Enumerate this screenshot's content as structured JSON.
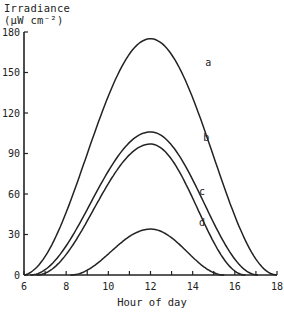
{
  "chart_data": {
    "type": "line",
    "title": "",
    "xlabel": "Hour of day",
    "ylabel_line1": "Irradiance",
    "ylabel_line2": "(μW cm⁻²)",
    "xlim": [
      6,
      18
    ],
    "ylim": [
      0,
      180
    ],
    "xticks": [
      6,
      8,
      10,
      12,
      14,
      16,
      18
    ],
    "xminor_ticks": [
      7,
      9,
      11,
      13,
      15,
      17
    ],
    "yticks": [
      0,
      30,
      60,
      90,
      120,
      150,
      180
    ],
    "grid": false,
    "legend": "curve labels placed beside curves",
    "series": [
      {
        "name": "a",
        "start": 5.9,
        "end": 18.0,
        "peak_x": 12.0,
        "peak": 175
      },
      {
        "name": "b",
        "start": 6.3,
        "end": 17.1,
        "peak_x": 12.0,
        "peak": 106
      },
      {
        "name": "c",
        "start": 6.6,
        "end": 16.5,
        "peak_x": 12.0,
        "peak": 97
      },
      {
        "name": "d",
        "start": 8.2,
        "end": 15.5,
        "peak_x": 12.0,
        "peak": 34
      }
    ],
    "label_positions": {
      "a": [
        14.6,
        155
      ],
      "b": [
        14.5,
        99
      ],
      "c": [
        14.3,
        59
      ],
      "d": [
        14.3,
        36
      ]
    }
  },
  "axis": {
    "ylabel_line1": "Irradiance",
    "ylabel_line2": "(μW cm⁻²)",
    "xlabel": "Hour  of day"
  }
}
